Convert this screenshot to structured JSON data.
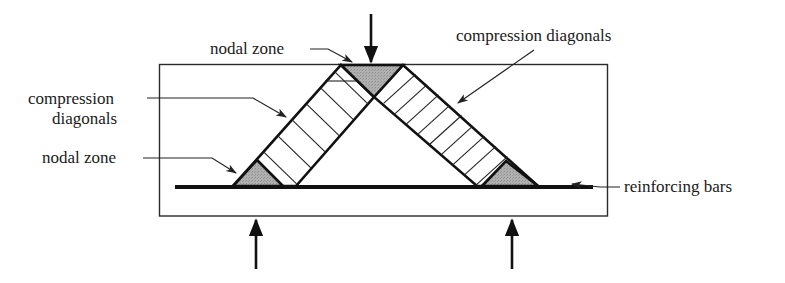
{
  "diagram": {
    "type": "strut-and-tie model",
    "labels": {
      "top_nodal_zone": "nodal zone",
      "left_compression_line1": "compression",
      "left_compression_line2": "diagonals",
      "right_compression": "compression diagonals",
      "bottom_nodal_zone": "nodal zone",
      "reinforcing": "reinforcing bars"
    },
    "colors": {
      "nodal_zone_fill": "#a9a9a9",
      "line": "#111111",
      "background": "#ffffff"
    },
    "elements": {
      "concrete_member": "rectangular beam outline",
      "struts": [
        "left compression diagonal",
        "right compression diagonal"
      ],
      "nodal_zones": [
        "top nodal zone",
        "bottom-left nodal zone",
        "bottom-right nodal zone"
      ],
      "tie": "reinforcing bars",
      "loads": [
        "applied load (top, downward)",
        "left support reaction (upward)",
        "right support reaction (upward)"
      ]
    }
  }
}
